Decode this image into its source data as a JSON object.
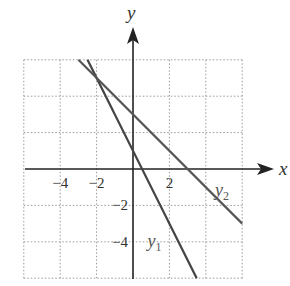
{
  "chart_data": {
    "type": "line",
    "title": "",
    "xlabel": "x",
    "ylabel": "y",
    "xlim": [
      -6,
      6
    ],
    "ylim": [
      -6,
      6
    ],
    "grid": true,
    "grid_step": 2,
    "x_ticks": [
      {
        "value": -4,
        "label": "−4"
      },
      {
        "value": -2,
        "label": "−2"
      },
      {
        "value": 2,
        "label": "2"
      }
    ],
    "y_ticks": [
      {
        "value": -2,
        "label": "−2"
      },
      {
        "value": -4,
        "label": "−4"
      }
    ],
    "series": [
      {
        "name": "y1",
        "label_main": "y",
        "label_sub": "1",
        "equation": "y = -2x + 1",
        "slope": -2,
        "intercept": 1,
        "color": "#444444",
        "label_pos": {
          "x": 0.8,
          "y": -4.3
        }
      },
      {
        "name": "y2",
        "label_main": "y",
        "label_sub": "2",
        "equation": "y = -x + 3",
        "slope": -1,
        "intercept": 3,
        "color": "#555555",
        "label_pos": {
          "x": 4.5,
          "y": -1.5
        }
      }
    ],
    "intersection": {
      "x": -2,
      "y": 5
    }
  },
  "colors": {
    "axis": "#222222",
    "grid": "#9a9a9a",
    "text": "#333333"
  }
}
